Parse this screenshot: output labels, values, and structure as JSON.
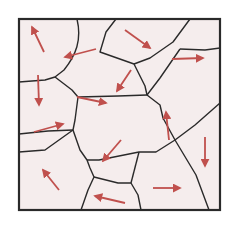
{
  "diagram": {
    "type": "grain-domain-map",
    "colors": {
      "background": "#ffffff",
      "grain_fill": "#f5eded",
      "boundary": "#2a2a2a",
      "arrow": "#c0504d"
    },
    "frame": {
      "x": 19,
      "y": 19,
      "width": 201,
      "height": 191
    },
    "boundaries": [
      "M 77 19 C 82 40, 76 55, 64 70 L 55 77",
      "M 19 82 L 45 80 L 55 77",
      "M 55 77 L 72 90 L 78 97",
      "M 78 97 L 118 96 L 147 95",
      "M 147 95 L 160 78 L 180 49",
      "M 147 95 L 145 86 L 134 64",
      "M 134 64 L 100 52 L 106 32 L 116 19",
      "M 134 64 L 150 58 L 173 42 L 190 19",
      "M 180 49 L 205 50",
      "M 205 50 L 220 48",
      "M 78 97 L 75 120 L 73 130",
      "M 73 130 L 48 131 L 19 134",
      "M 73 130 L 80 150 L 87 160",
      "M 147 95 L 160 105 L 163 118 L 175 140",
      "M 175 140 L 156 152 L 139 152",
      "M 175 140 L 195 125 L 220 103",
      "M 87 160 L 99 160 L 139 152",
      "M 87 160 L 90 168 L 94 177 L 88 190 L 81 210",
      "M 94 177 L 118 183 L 131 183",
      "M 139 152 L 131 183",
      "M 131 183 L 138 195 L 141 210",
      "M 175 140 L 196 175 L 209 210",
      "M 19 152 L 45 150 L 73 130"
    ],
    "arrows": [
      {
        "x1": 44,
        "y1": 52,
        "x2": 32,
        "y2": 27,
        "label": "grain-1"
      },
      {
        "x1": 96,
        "y1": 49,
        "x2": 65,
        "y2": 57,
        "label": "grain-2"
      },
      {
        "x1": 125,
        "y1": 30,
        "x2": 150,
        "y2": 48,
        "label": "grain-3"
      },
      {
        "x1": 172,
        "y1": 59,
        "x2": 203,
        "y2": 58,
        "label": "grain-4"
      },
      {
        "x1": 38,
        "y1": 75,
        "x2": 39,
        "y2": 105,
        "label": "grain-5"
      },
      {
        "x1": 77,
        "y1": 97,
        "x2": 106,
        "y2": 103,
        "label": "grain-6"
      },
      {
        "x1": 131,
        "y1": 70,
        "x2": 117,
        "y2": 91,
        "label": "grain-7"
      },
      {
        "x1": 34,
        "y1": 132,
        "x2": 63,
        "y2": 124,
        "label": "grain-8"
      },
      {
        "x1": 121,
        "y1": 140,
        "x2": 103,
        "y2": 161,
        "label": "grain-9"
      },
      {
        "x1": 169,
        "y1": 140,
        "x2": 166,
        "y2": 112,
        "label": "grain-10"
      },
      {
        "x1": 205,
        "y1": 137,
        "x2": 205,
        "y2": 166,
        "label": "grain-11"
      },
      {
        "x1": 59,
        "y1": 190,
        "x2": 43,
        "y2": 170,
        "label": "grain-12"
      },
      {
        "x1": 125,
        "y1": 203,
        "x2": 95,
        "y2": 196,
        "label": "grain-13"
      },
      {
        "x1": 153,
        "y1": 188,
        "x2": 180,
        "y2": 188,
        "label": "grain-14"
      }
    ]
  }
}
